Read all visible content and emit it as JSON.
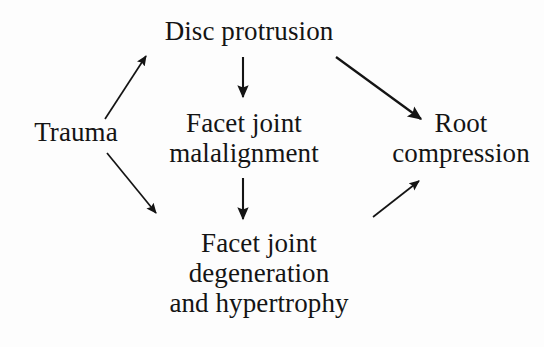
{
  "diagram": {
    "background_color": "#fdfdfd",
    "text_color": "#141414",
    "arrow_color": "#141414",
    "nodes": [
      {
        "id": "trauma",
        "lines": [
          "Trauma"
        ],
        "center_x": 76,
        "center_y": 131
      },
      {
        "id": "disc-protrusion",
        "lines": [
          "Disc protrusion"
        ],
        "center_x": 249,
        "center_y": 38
      },
      {
        "id": "facet-joint-malalignment",
        "lines": [
          "Facet joint",
          "malalignment"
        ],
        "center_x": 244,
        "center_y": 141
      },
      {
        "id": "facet-joint-degeneration",
        "lines": [
          "Facet joint",
          "degeneration",
          "and hypertrophy"
        ],
        "center_x": 259,
        "center_y": 275
      },
      {
        "id": "root-compression",
        "lines": [
          "Root",
          "compression"
        ],
        "center_x": 459,
        "center_y": 141
      }
    ],
    "arrows": [
      {
        "id": "trauma-to-disc-protrusion",
        "from": "trauma",
        "to": "disc-protrusion",
        "style": "straight",
        "x1": 105,
        "y1": 119,
        "x2": 146,
        "y2": 56
      },
      {
        "id": "trauma-to-facet-degeneration",
        "from": "trauma",
        "to": "facet-joint-degeneration",
        "style": "straight",
        "x1": 107,
        "y1": 153,
        "x2": 156,
        "y2": 213
      },
      {
        "id": "disc-protrusion-to-facet-malalignment",
        "from": "disc-protrusion",
        "to": "facet-joint-malalignment",
        "style": "straight",
        "x1": 243,
        "y1": 57,
        "x2": 243,
        "y2": 97
      },
      {
        "id": "disc-protrusion-to-root-compression",
        "from": "disc-protrusion",
        "to": "root-compression",
        "style": "straight",
        "x1": 336,
        "y1": 57,
        "x2": 421,
        "y2": 119
      },
      {
        "id": "facet-malalignment-to-facet-degeneration",
        "from": "facet-joint-malalignment",
        "to": "facet-joint-degeneration",
        "style": "straight",
        "x1": 243,
        "y1": 178,
        "x2": 243,
        "y2": 219
      },
      {
        "id": "facet-degeneration-to-root-compression",
        "from": "facet-joint-degeneration",
        "to": "root-compression",
        "style": "straight",
        "x1": 373,
        "y1": 217,
        "x2": 419,
        "y2": 181
      }
    ]
  }
}
